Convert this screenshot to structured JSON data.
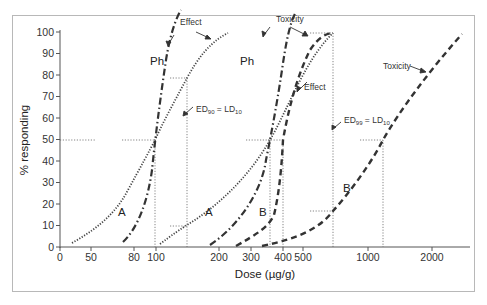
{
  "chart_data": {
    "type": "line",
    "title": "",
    "xlabel": "Dose (µg/g)",
    "ylabel": "% responding",
    "xscale": "log",
    "x_ticks": [
      "0",
      "50",
      "80",
      "100",
      "200",
      "300",
      "400",
      "500",
      "1000",
      "2000"
    ],
    "y_ticks": [
      "0",
      "10",
      "20",
      "30",
      "40",
      "50",
      "60",
      "70",
      "80",
      "90",
      "100"
    ],
    "ylim": [
      0,
      100
    ],
    "grid": false,
    "legend": "none (inline annotations)",
    "series": [
      {
        "name": "A (effect, shallow slope) - left",
        "style": "dotted",
        "points": [
          [
            45,
            2
          ],
          [
            70,
            12
          ],
          [
            100,
            50
          ],
          [
            140,
            80
          ],
          [
            190,
            98
          ]
        ]
      },
      {
        "name": "Ph (effect, steep slope) - left",
        "style": "dash-dot",
        "points": [
          [
            75,
            2
          ],
          [
            90,
            20
          ],
          [
            100,
            50
          ],
          [
            110,
            80
          ],
          [
            117,
            99
          ]
        ]
      },
      {
        "name": "A (toxicity, shallow slope) - middle",
        "style": "dotted",
        "points": [
          [
            105,
            2
          ],
          [
            140,
            10
          ],
          [
            265,
            50
          ],
          [
            380,
            80
          ],
          [
            530,
            98
          ]
        ]
      },
      {
        "name": "Ph (toxicity, steep slope) - middle",
        "style": "dash-dot",
        "points": [
          [
            185,
            1
          ],
          [
            230,
            20
          ],
          [
            265,
            50
          ],
          [
            290,
            80
          ],
          [
            300,
            99
          ]
        ]
      },
      {
        "name": "B (effect, shallow slope) - middle",
        "style": "dashed",
        "points": [
          [
            240,
            1
          ],
          [
            270,
            10
          ],
          [
            400,
            50
          ],
          [
            500,
            80
          ],
          [
            680,
            99
          ]
        ]
      },
      {
        "name": "B (toxicity, shallow slope) - right",
        "style": "dashed",
        "points": [
          [
            330,
            0
          ],
          [
            500,
            5
          ],
          [
            700,
            20
          ],
          [
            1150,
            50
          ],
          [
            1800,
            80
          ],
          [
            2600,
            96
          ]
        ]
      }
    ],
    "annotations": [
      {
        "text": "Effect",
        "target": "left group top"
      },
      {
        "text": "Ph",
        "target": "left dash-dot curve"
      },
      {
        "text": "ED90 = LD10",
        "target": "left pair, dose ~140"
      },
      {
        "text": "A",
        "target": "left dotted curve"
      },
      {
        "text": "Toxicity",
        "target": "middle group top"
      },
      {
        "text": "Ph",
        "target": "middle dash-dot curve"
      },
      {
        "text": "A",
        "target": "middle dotted curve"
      },
      {
        "text": "Effect",
        "target": "middle dashed curve"
      },
      {
        "text": "B",
        "target": "middle dashed curve"
      },
      {
        "text": "ED99 = LD10",
        "target": "right pair, dose ~700"
      },
      {
        "text": "Toxicity",
        "target": "right dashed curve"
      },
      {
        "text": "B",
        "target": "right dashed curve"
      }
    ]
  },
  "labels": {
    "ylabel": "% responding",
    "xlabel": "Dose (µg/g)",
    "effect_left": "Effect",
    "ph_left": "Ph",
    "ed90": "ED",
    "ed90_sub": "90",
    "ld10_a": "LD",
    "ld10_a_sub": "10",
    "eq": " = ",
    "a_left": "A",
    "toxicity_mid": "Toxicity",
    "ph_mid": "Ph",
    "a_mid": "A",
    "effect_mid": "Effect",
    "b_mid": "B",
    "ed99": "ED",
    "ed99_sub": "99",
    "ld10_b": "LD",
    "ld10_b_sub": "10",
    "toxicity_right": "Toxicity",
    "b_right": "B"
  },
  "y_ticks": [
    {
      "label": "100",
      "y": 32
    },
    {
      "label": "90",
      "y": 53.5
    },
    {
      "label": "80",
      "y": 75
    },
    {
      "label": "70",
      "y": 96.5
    },
    {
      "label": "60",
      "y": 118
    },
    {
      "label": "50",
      "y": 139.5
    },
    {
      "label": "40",
      "y": 161
    },
    {
      "label": "30",
      "y": 182.5
    },
    {
      "label": "20",
      "y": 204
    },
    {
      "label": "10",
      "y": 225.5
    },
    {
      "label": "0",
      "y": 247
    }
  ],
  "x_ticks": [
    {
      "label": "0",
      "x": 60
    },
    {
      "label": "50",
      "x": 91
    },
    {
      "label": "80",
      "x": 134
    },
    {
      "label": "100",
      "x": 156
    },
    {
      "label": "200",
      "x": 219
    },
    {
      "label": "300",
      "x": 251
    },
    {
      "label": "400",
      "x": 283
    },
    {
      "label": "500",
      "x": 303
    },
    {
      "label": "1000",
      "x": 368
    },
    {
      "label": "2000",
      "x": 432
    }
  ]
}
